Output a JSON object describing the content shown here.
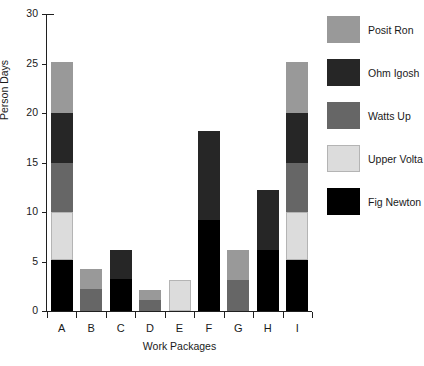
{
  "chart_data": {
    "type": "bar",
    "subtype": "stacked-bar",
    "title": "",
    "xlabel": "Work Packages",
    "ylabel": "Person Days",
    "categories": [
      "A",
      "B",
      "C",
      "D",
      "E",
      "F",
      "G",
      "H",
      "I"
    ],
    "ylim": [
      0,
      30
    ],
    "yticks": [
      0,
      5,
      10,
      15,
      20,
      25,
      30
    ],
    "grid": false,
    "legend_position": "right",
    "series": [
      {
        "name": "Fig Newton",
        "color": "#000000",
        "values": [
          5.2,
          0,
          3.2,
          0,
          0,
          9.2,
          0,
          6.2,
          5.2
        ]
      },
      {
        "name": "Upper Volta",
        "color": "#dcdcdc",
        "values": [
          4.8,
          0,
          0,
          0,
          3.1,
          0,
          0,
          0,
          4.8
        ]
      },
      {
        "name": "Watts Up",
        "color": "#666666",
        "values": [
          5.0,
          2.2,
          0,
          1.1,
          0,
          0,
          3.1,
          0,
          5.0
        ]
      },
      {
        "name": "Ohm Igosh",
        "color": "#262626",
        "values": [
          5.0,
          0,
          3.0,
          0,
          0,
          9.0,
          0,
          6.0,
          5.0
        ]
      },
      {
        "name": "Posit Ron",
        "color": "#999999",
        "values": [
          5.2,
          2.0,
          0,
          1.0,
          0,
          0,
          3.1,
          0,
          5.2
        ]
      }
    ],
    "totals": [
      25.2,
      4.2,
      6.2,
      2.1,
      3.1,
      18.2,
      6.2,
      12.2,
      25.2
    ]
  },
  "legend": {
    "entries": [
      {
        "label": "Posit Ron",
        "color": "#999999"
      },
      {
        "label": "Ohm Igosh",
        "color": "#262626"
      },
      {
        "label": "Watts Up",
        "color": "#666666"
      },
      {
        "label": "Upper Volta",
        "color": "#dcdcdc"
      },
      {
        "label": "Fig Newton",
        "color": "#000000"
      }
    ]
  },
  "axes": {
    "y_title": "Person Days",
    "x_title": "Work Packages",
    "y_tick_labels": [
      "0",
      "5",
      "10",
      "15",
      "20",
      "25",
      "30"
    ],
    "x_tick_labels": [
      "A",
      "B",
      "C",
      "D",
      "E",
      "F",
      "G",
      "H",
      "I"
    ]
  }
}
